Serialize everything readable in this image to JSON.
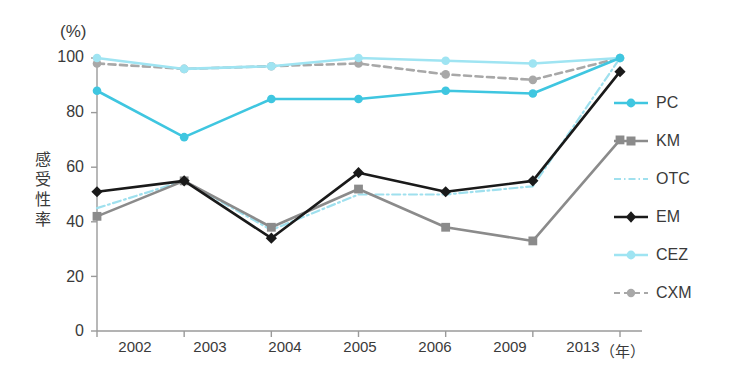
{
  "chart_data": {
    "type": "line",
    "title": "",
    "xlabel": "(年)",
    "ylabel": "感受性率",
    "yunit": "(%)",
    "categories": [
      "2002",
      "2003",
      "2004",
      "2005",
      "2006",
      "2009",
      "2013"
    ],
    "ylim": [
      0,
      100
    ],
    "yticks": [
      0,
      20,
      40,
      60,
      80,
      100
    ],
    "grid": false,
    "legend_position": "right",
    "series": [
      {
        "name": "PC",
        "values": [
          88,
          71,
          85,
          85,
          88,
          87,
          100
        ],
        "color": "#3fc6e0",
        "marker": "circle",
        "dash": "solid"
      },
      {
        "name": "KM",
        "values": [
          42,
          55,
          38,
          52,
          38,
          33,
          70
        ],
        "color": "#8b8b8b",
        "marker": "square",
        "dash": "solid"
      },
      {
        "name": "OTC",
        "values": [
          45,
          55,
          37,
          50,
          50,
          53,
          100
        ],
        "color": "#9fe0ee",
        "marker": "none",
        "dash": "dashdot"
      },
      {
        "name": "EM",
        "values": [
          51,
          55,
          34,
          58,
          51,
          55,
          95
        ],
        "color": "#1a1a1a",
        "marker": "diamond",
        "dash": "solid"
      },
      {
        "name": "CEZ",
        "values": [
          100,
          96,
          97,
          100,
          99,
          98,
          100
        ],
        "color": "#9fe4f2",
        "marker": "circle",
        "dash": "solid"
      },
      {
        "name": "CXM",
        "values": [
          98,
          96,
          97,
          98,
          94,
          92,
          100
        ],
        "color": "#a8a8a8",
        "marker": "circle",
        "dash": "dashed"
      }
    ]
  },
  "axis": {
    "yticks": [
      "100",
      "80",
      "60",
      "40",
      "20",
      "0"
    ],
    "xticks": [
      "2002",
      "2003",
      "2004",
      "2005",
      "2006",
      "2009",
      "2013"
    ],
    "ylabel_chars": [
      "感",
      "受",
      "性",
      "率"
    ],
    "percent_unit": "(%)",
    "year_unit": "（年）"
  },
  "legend": {
    "items": [
      {
        "label": "PC"
      },
      {
        "label": "KM"
      },
      {
        "label": "OTC"
      },
      {
        "label": "EM"
      },
      {
        "label": "CEZ"
      },
      {
        "label": "CXM"
      }
    ]
  },
  "colors": {
    "pc": "#3fc6e0",
    "km": "#8b8b8b",
    "otc": "#9fe0ee",
    "em": "#1a1a1a",
    "cez": "#9fe4f2",
    "cxm": "#a8a8a8",
    "axis": "#9a9a9a",
    "text": "#3a3a3a"
  }
}
